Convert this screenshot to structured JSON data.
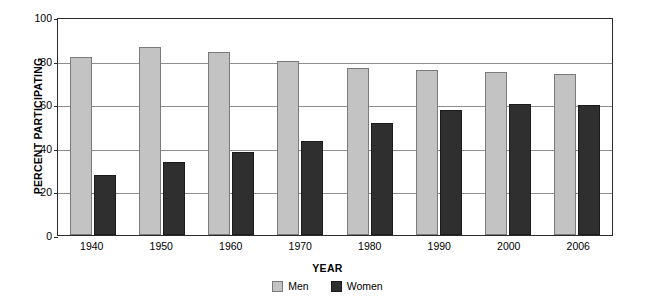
{
  "chart_data": {
    "type": "bar",
    "title": "",
    "xlabel": "YEAR",
    "ylabel": "PERCENT PARTICIPATING",
    "categories": [
      "1940",
      "1950",
      "1960",
      "1970",
      "1980",
      "1990",
      "2000",
      "2006"
    ],
    "series": [
      {
        "name": "Men",
        "color": "#c3c3c3",
        "values": [
          82.5,
          87.0,
          84.5,
          80.5,
          77.5,
          76.5,
          75.5,
          74.5
        ]
      },
      {
        "name": "Women",
        "color": "#2f2f2f",
        "values": [
          28.0,
          34.0,
          38.5,
          43.5,
          52.0,
          58.0,
          60.5,
          60.0
        ]
      }
    ],
    "ylim": [
      0,
      100
    ],
    "yticks": [
      "0",
      "20",
      "40",
      "60",
      "80",
      "100"
    ],
    "grid": true,
    "legend_position": "bottom"
  }
}
